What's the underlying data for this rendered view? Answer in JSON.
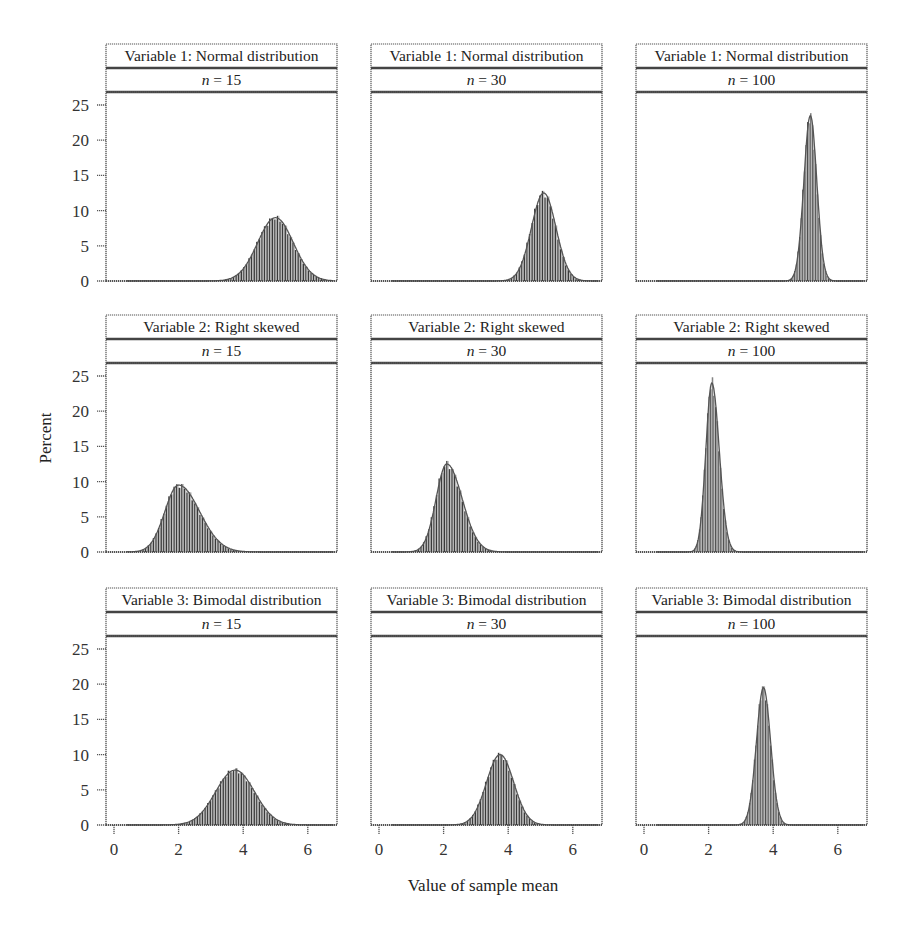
{
  "figure": {
    "y_axis_label": "Percent",
    "x_axis_label": "Value of sample mean",
    "y_ticks": [
      0,
      5,
      10,
      15,
      20,
      25
    ],
    "x_ticks": [
      0,
      2,
      4,
      6
    ],
    "colors": {
      "bar_dark": "#3a3a3a",
      "bar_light": "#b8b8b8",
      "frame": "#555555",
      "background": "#ffffff"
    }
  },
  "chart_data": {
    "type": "bar",
    "title": "",
    "subtitle": "Sampling distributions of the sample mean by variable and sample size",
    "xlabel": "Value of sample mean",
    "ylabel": "Percent",
    "xlim": [
      -0.3,
      6.9
    ],
    "ylim": [
      0,
      27
    ],
    "x_ticks": [
      0,
      2,
      4,
      6
    ],
    "y_ticks": [
      0,
      5,
      10,
      15,
      20,
      25
    ],
    "grid": false,
    "legend": null,
    "layout": "3x3 facet grid (rows = variable, columns = sample size n)",
    "panels": [
      {
        "row": 0,
        "col": 0,
        "title": "Variable 1: Normal distribution",
        "n_label": "n = 15",
        "n": 15,
        "mean": 5.0,
        "sd": 0.55,
        "peak_percent": 9,
        "range": [
          3.5,
          6.8
        ]
      },
      {
        "row": 0,
        "col": 1,
        "title": "Variable 1: Normal distribution",
        "n_label": "n = 30",
        "n": 30,
        "mean": 5.1,
        "sd": 0.38,
        "peak_percent": 12.5,
        "range": [
          4.0,
          6.3
        ]
      },
      {
        "row": 0,
        "col": 2,
        "title": "Variable 1: Normal distribution",
        "n_label": "n = 100",
        "n": 100,
        "mean": 5.15,
        "sd": 0.2,
        "peak_percent": 23.5,
        "range": [
          4.6,
          5.7
        ]
      },
      {
        "row": 1,
        "col": 0,
        "title": "Variable 2: Right skewed",
        "n_label": "n = 15",
        "n": 15,
        "mean": 2.0,
        "sd": 0.5,
        "peak_percent": 9.5,
        "range": [
          0.6,
          3.8
        ],
        "skew": 0.3
      },
      {
        "row": 1,
        "col": 1,
        "title": "Variable 2: Right skewed",
        "n_label": "n = 30",
        "n": 30,
        "mean": 2.1,
        "sd": 0.38,
        "peak_percent": 12.5,
        "range": [
          1.0,
          3.3
        ],
        "skew": 0.25
      },
      {
        "row": 1,
        "col": 2,
        "title": "Variable 2: Right skewed",
        "n_label": "n = 100",
        "n": 100,
        "mean": 2.1,
        "sd": 0.2,
        "peak_percent": 24,
        "range": [
          1.6,
          2.7
        ],
        "skew": 0.15
      },
      {
        "row": 2,
        "col": 0,
        "title": "Variable 3: Bimodal distribution",
        "n_label": "n = 15",
        "n": 15,
        "mean": 3.75,
        "sd": 0.6,
        "peak_percent": 7.8,
        "range": [
          2.0,
          5.6
        ]
      },
      {
        "row": 2,
        "col": 1,
        "title": "Variable 3: Bimodal distribution",
        "n_label": "n = 30",
        "n": 30,
        "mean": 3.75,
        "sd": 0.42,
        "peak_percent": 10,
        "range": [
          2.6,
          5.0
        ]
      },
      {
        "row": 2,
        "col": 2,
        "title": "Variable 3: Bimodal distribution",
        "n_label": "n = 100",
        "n": 100,
        "mean": 3.7,
        "sd": 0.22,
        "peak_percent": 19.5,
        "range": [
          3.0,
          4.5
        ]
      }
    ]
  }
}
